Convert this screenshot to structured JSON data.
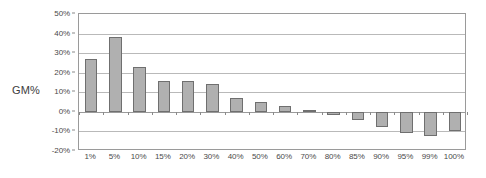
{
  "chart_data": {
    "type": "bar",
    "title": "",
    "xlabel": "",
    "ylabel": "GM%",
    "ylim": [
      -20,
      50
    ],
    "ytick_values": [
      50,
      40,
      30,
      20,
      10,
      0,
      -10,
      -20
    ],
    "ytick_labels": [
      "50%",
      "40%",
      "30%",
      "20%",
      "10%",
      "0%",
      "-10%",
      "-20%"
    ],
    "grid": true,
    "legend": "none",
    "categories": [
      "1%",
      "5%",
      "10%",
      "15%",
      "20%",
      "30%",
      "40%",
      "50%",
      "60%",
      "70%",
      "80%",
      "85%",
      "90%",
      "95%",
      "99%",
      "100%"
    ],
    "values": [
      27,
      38,
      23,
      16,
      16,
      14,
      7,
      5,
      3,
      1,
      -1.5,
      -4,
      -7.5,
      -11,
      -12.5,
      -10
    ],
    "value_labels": [
      "27%",
      "38%",
      "23%",
      "16%",
      "16%",
      "14%",
      "7%",
      "5%",
      "3%",
      "1%",
      "-1.5%",
      "-4%",
      "-7.5%",
      "-11%",
      "-12.5%",
      "-10%"
    ],
    "bar_fill_color": "#b0b0b0",
    "bar_border_color": "#6f6f6f",
    "gridline_color": "#b9b9b9",
    "axis_color": "#9a9a9a",
    "plot_background": "#ffffff"
  }
}
